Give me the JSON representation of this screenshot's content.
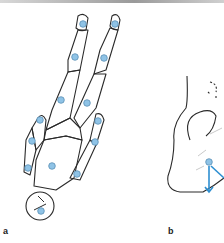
{
  "figure": {
    "panels": [
      {
        "label": "a",
        "description": "Figure outline lying supine with marker points"
      },
      {
        "label": "b",
        "description": "Foot side view with marker point and axis arrows"
      }
    ],
    "colors": {
      "outline": "#2a2a2a",
      "marker_fill": "#8fc3e6",
      "marker_stroke": "#5a8fb5",
      "arrow": "#2d8fd1"
    }
  }
}
